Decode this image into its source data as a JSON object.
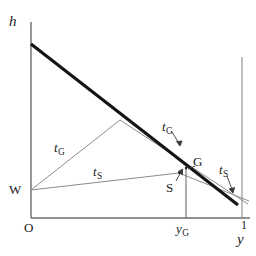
{
  "figure": {
    "type": "line-diagram",
    "background_color": "#ffffff",
    "axis_color": "#6b6b6b",
    "thin_line_color": "#8c8c8c",
    "thick_line_color": "#141414",
    "text_color": "#1a1a1a",
    "width": 256,
    "height": 256
  },
  "axes": {
    "y_axis_label": "h",
    "x_axis_label": "y",
    "origin_label": "O",
    "x_max_tick_label": "1",
    "x_axis": {
      "x_start": 31,
      "x_end": 250,
      "y": 218
    },
    "y_axis": {
      "x": 31,
      "y_top": 22,
      "y_bottom": 218
    },
    "right_tick_line": {
      "x": 242,
      "y_top": 57,
      "y_bottom": 218
    }
  },
  "points": {
    "W": {
      "label": "W",
      "x": 31,
      "y": 190
    },
    "G": {
      "label": "G",
      "x": 186,
      "y": 168
    },
    "S": {
      "label": "S",
      "x": 179,
      "y": 173
    },
    "y_G": {
      "label": "y_G",
      "x": 186,
      "y": 218
    }
  },
  "labels": {
    "h": "h",
    "y": "y",
    "O": "O",
    "one": "1",
    "W": "W",
    "G": "G",
    "S": "S",
    "y_G_base": "y",
    "y_G_sub": "G",
    "t_base": "t",
    "t_G_sub": "G",
    "t_S_sub": "S"
  },
  "curves": {
    "main_thick_line": {
      "name": "budget-line",
      "from": {
        "x": 31,
        "y": 44
      },
      "to": {
        "x": 238,
        "y": 205
      },
      "stroke_width": 3.0,
      "color": "#141414"
    },
    "t_G_from_W": {
      "name": "tG-ray-left",
      "from": {
        "x": 31,
        "y": 190
      },
      "to": {
        "x": 186,
        "y": 168
      },
      "via": {
        "x": 120,
        "y": 120
      },
      "color": "#8c8c8c"
    },
    "t_S_from_W": {
      "name": "tS-ray-left",
      "from": {
        "x": 31,
        "y": 190
      },
      "to": {
        "x": 179,
        "y": 173
      },
      "color": "#8c8c8c"
    },
    "t_G_right": {
      "name": "tG-ray-right",
      "from": {
        "x": 120,
        "y": 120
      },
      "to": {
        "x": 248,
        "y": 204
      },
      "color": "#8c8c8c"
    },
    "t_S_right": {
      "name": "tS-ray-right",
      "from": {
        "x": 179,
        "y": 173
      },
      "to": {
        "x": 249,
        "y": 200
      },
      "color": "#8c8c8c"
    },
    "y_G_drop_line": {
      "name": "yG-drop-line",
      "from": {
        "x": 186,
        "y": 168
      },
      "to": {
        "x": 186,
        "y": 218
      },
      "color": "#6b6b6b"
    }
  },
  "leaders": [
    {
      "name": "tG-right-leader",
      "from": {
        "x": 172,
        "y": 131
      },
      "to": {
        "x": 180,
        "y": 144
      }
    },
    {
      "name": "tS-right-leader",
      "from": {
        "x": 226,
        "y": 175
      },
      "to": {
        "x": 232,
        "y": 191
      }
    },
    {
      "name": "S-leader",
      "from": {
        "x": 177,
        "y": 180
      },
      "to": {
        "x": 182,
        "y": 170
      }
    }
  ]
}
